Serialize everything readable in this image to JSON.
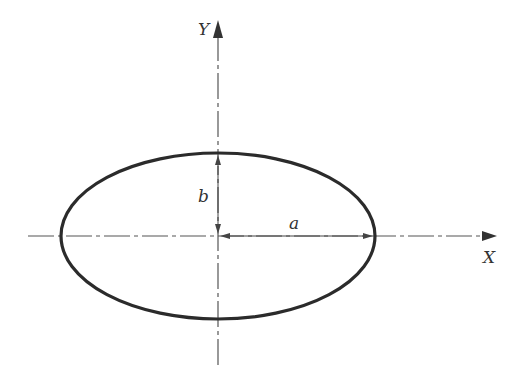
{
  "diagram": {
    "type": "ellipse-geometry",
    "center": {
      "x": 218,
      "y": 236
    },
    "semi_major_px": 157,
    "semi_minor_px": 83,
    "colors": {
      "ellipse": "#2b2b2b",
      "axis": "#555555",
      "dimension": "#444444",
      "text": "#333333"
    },
    "labels": {
      "x_axis": "X",
      "y_axis": "Y",
      "semi_major": "a",
      "semi_minor": "b"
    }
  }
}
